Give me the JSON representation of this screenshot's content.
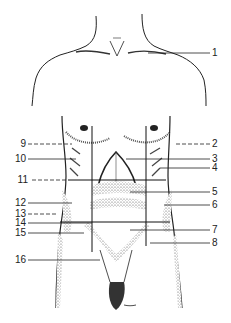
{
  "figure": {
    "type": "anatomical-diagram",
    "colors": {
      "line": "#222222",
      "stipple": "#555555",
      "background": "#ffffff"
    }
  },
  "labels": [
    {
      "id": "1",
      "text": "1",
      "side": "right",
      "leader": "solid",
      "x": 212,
      "y": 53
    },
    {
      "id": "2",
      "text": "2",
      "side": "right",
      "leader": "dashed",
      "x": 212,
      "y": 144
    },
    {
      "id": "3",
      "text": "3",
      "side": "right",
      "leader": "solid",
      "x": 212,
      "y": 159
    },
    {
      "id": "4",
      "text": "4",
      "side": "right",
      "leader": "solid",
      "x": 212,
      "y": 168
    },
    {
      "id": "5",
      "text": "5",
      "side": "right",
      "leader": "solid",
      "x": 212,
      "y": 192
    },
    {
      "id": "6",
      "text": "6",
      "side": "right",
      "leader": "solid",
      "x": 212,
      "y": 205
    },
    {
      "id": "7",
      "text": "7",
      "side": "right",
      "leader": "solid",
      "x": 212,
      "y": 230
    },
    {
      "id": "8",
      "text": "8",
      "side": "right",
      "leader": "solid",
      "x": 212,
      "y": 243
    },
    {
      "id": "9",
      "text": "9",
      "side": "left",
      "leader": "dashed",
      "x": 16,
      "y": 144
    },
    {
      "id": "10",
      "text": "10",
      "side": "left",
      "leader": "solid",
      "x": 16,
      "y": 159
    },
    {
      "id": "11",
      "text": "11",
      "side": "left",
      "leader": "dashed",
      "x": 16,
      "y": 180
    },
    {
      "id": "12",
      "text": "12",
      "side": "left",
      "leader": "solid",
      "x": 16,
      "y": 203
    },
    {
      "id": "13",
      "text": "13",
      "side": "left",
      "leader": "dashed",
      "x": 16,
      "y": 214
    },
    {
      "id": "14",
      "text": "14",
      "side": "left",
      "leader": "solid",
      "x": 16,
      "y": 223
    },
    {
      "id": "15",
      "text": "15",
      "side": "left",
      "leader": "solid",
      "x": 16,
      "y": 233
    },
    {
      "id": "16",
      "text": "16",
      "side": "left",
      "leader": "solid",
      "x": 16,
      "y": 260
    }
  ]
}
